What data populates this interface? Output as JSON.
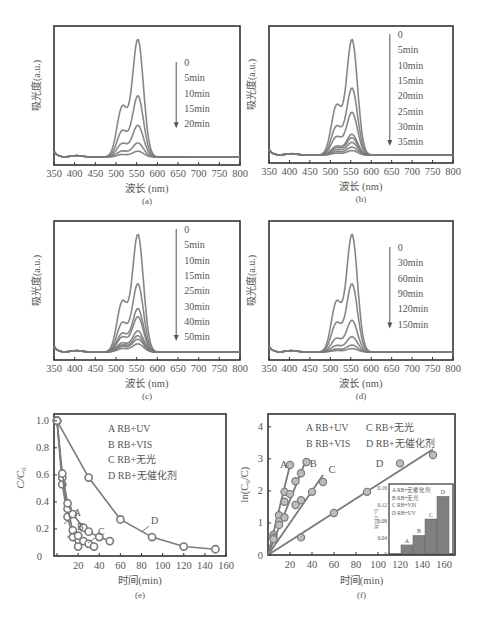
{
  "colors": {
    "axis": "#333333",
    "curve": "#7a7a7a",
    "text": "#555555",
    "marker_fill": "#bdbdbd",
    "marker_open": "#ffffff",
    "bar": "#808080"
  },
  "chart_data": [
    {
      "id": "a",
      "type": "line",
      "panel_label": "(a)",
      "xlabel": "波长 (nm)",
      "ylabel": "吸光度(a.u.)",
      "x_ticks": [
        350,
        400,
        450,
        500,
        550,
        600,
        650,
        700,
        750,
        800
      ],
      "xlim": [
        350,
        800
      ],
      "legend_arrow": true,
      "legend": [
        "0",
        "5min",
        "10min",
        "15min",
        "20min"
      ],
      "peak_wavelength": 550,
      "series": [
        {
          "name": "0",
          "peak": 1.0
        },
        {
          "name": "5min",
          "peak": 0.52
        },
        {
          "name": "10min",
          "peak": 0.27
        },
        {
          "name": "15min",
          "peak": 0.12
        },
        {
          "name": "20min",
          "peak": 0.05
        }
      ]
    },
    {
      "id": "b",
      "type": "line",
      "panel_label": "(b)",
      "xlabel": "波长 (nm)",
      "ylabel": "吸光度(a.u.)",
      "x_ticks": [
        350,
        400,
        450,
        500,
        550,
        600,
        650,
        700,
        750,
        800
      ],
      "xlim": [
        350,
        800
      ],
      "legend_arrow": true,
      "legend": [
        "0",
        "5min",
        "10min",
        "15min",
        "20min",
        "25min",
        "30min",
        "35min"
      ],
      "peak_wavelength": 550,
      "series": [
        {
          "name": "0",
          "peak": 1.0
        },
        {
          "name": "5min",
          "peak": 0.58
        },
        {
          "name": "10min",
          "peak": 0.37
        },
        {
          "name": "15min",
          "peak": 0.18
        },
        {
          "name": "20min",
          "peak": 0.15
        },
        {
          "name": "25min",
          "peak": 0.11
        },
        {
          "name": "30min",
          "peak": 0.07
        },
        {
          "name": "35min",
          "peak": 0.04
        }
      ]
    },
    {
      "id": "c",
      "type": "line",
      "panel_label": "(c)",
      "xlabel": "波长 (nm)",
      "ylabel": "吸光度(a.u.)",
      "x_ticks": [
        350,
        400,
        450,
        500,
        550,
        600,
        650,
        700,
        750,
        800
      ],
      "xlim": [
        350,
        800
      ],
      "legend_arrow": true,
      "legend": [
        "0",
        "5min",
        "10min",
        "15min",
        "25min",
        "30min",
        "40min",
        "50min"
      ],
      "peak_wavelength": 550,
      "series": [
        {
          "name": "0",
          "peak": 1.0
        },
        {
          "name": "5min",
          "peak": 0.58
        },
        {
          "name": "10min",
          "peak": 0.37
        },
        {
          "name": "15min",
          "peak": 0.3
        },
        {
          "name": "25min",
          "peak": 0.18
        },
        {
          "name": "30min",
          "peak": 0.14
        },
        {
          "name": "40min",
          "peak": 0.11
        },
        {
          "name": "50min",
          "peak": 0.07
        }
      ]
    },
    {
      "id": "d",
      "type": "line",
      "panel_label": "(d)",
      "xlabel": "波长 (nm)",
      "ylabel": "吸光度(a.u.)",
      "x_ticks": [
        350,
        400,
        450,
        500,
        550,
        600,
        650,
        700,
        750,
        800
      ],
      "xlim": [
        350,
        800
      ],
      "legend_arrow": true,
      "legend": [
        "0",
        "30min",
        "60min",
        "90min",
        "120min",
        "150min"
      ],
      "peak_wavelength": 550,
      "series": [
        {
          "name": "0",
          "peak": 1.0
        },
        {
          "name": "30min",
          "peak": 0.58
        },
        {
          "name": "60min",
          "peak": 0.27
        },
        {
          "name": "90min",
          "peak": 0.13
        },
        {
          "name": "120min",
          "peak": 0.06
        },
        {
          "name": "150min",
          "peak": 0.03
        }
      ]
    },
    {
      "id": "e",
      "type": "line",
      "panel_label": "(e)",
      "xlabel": "时间(min)",
      "ylabel": "C/C0",
      "x_ticks": [
        0,
        20,
        40,
        60,
        80,
        100,
        120,
        140,
        160
      ],
      "y_ticks": [
        0,
        0.2,
        0.4,
        0.6,
        0.8,
        1.0
      ],
      "xlim": [
        0,
        160
      ],
      "ylim": [
        0,
        1.05
      ],
      "legend": [
        "A  RB+UV",
        "B  RB+VIS",
        "C  RB+无光",
        "D  RB+无催化剂"
      ],
      "series": [
        {
          "name": "A",
          "label": "A",
          "x": [
            0,
            5,
            10,
            15,
            20
          ],
          "y": [
            1.0,
            0.53,
            0.29,
            0.14,
            0.07
          ]
        },
        {
          "name": "B",
          "label": "B",
          "x": [
            0,
            5,
            10,
            15,
            20,
            25,
            30,
            35
          ],
          "y": [
            1.0,
            0.58,
            0.35,
            0.19,
            0.15,
            0.11,
            0.09,
            0.07
          ]
        },
        {
          "name": "C",
          "label": "C",
          "x": [
            0,
            5,
            10,
            15,
            25,
            30,
            40,
            50
          ],
          "y": [
            1.0,
            0.61,
            0.39,
            0.31,
            0.21,
            0.18,
            0.14,
            0.11
          ]
        },
        {
          "name": "D",
          "label": "D",
          "x": [
            0,
            30,
            60,
            90,
            120,
            150
          ],
          "y": [
            1.0,
            0.58,
            0.27,
            0.14,
            0.07,
            0.05
          ]
        }
      ]
    },
    {
      "id": "f",
      "type": "scatter",
      "panel_label": "(f)",
      "xlabel": "时间(min)",
      "ylabel": "ln(C0/C)",
      "x_ticks": [
        20,
        40,
        60,
        80,
        100,
        120,
        140,
        160
      ],
      "y_ticks": [
        0,
        1,
        2,
        3,
        4
      ],
      "xlim": [
        0,
        170
      ],
      "ylim": [
        0,
        4.4
      ],
      "legend": [
        "A RB+UV",
        "C RB+无光",
        "B RB+VIS",
        "D RB+无催化剂"
      ],
      "series": [
        {
          "name": "A",
          "label": "A",
          "x": [
            5,
            10,
            15,
            20
          ],
          "y": [
            0.63,
            1.24,
            1.97,
            2.81
          ],
          "fit_end": [
            20,
            2.81
          ]
        },
        {
          "name": "B",
          "label": "B",
          "x": [
            5,
            10,
            15,
            20,
            25,
            30,
            35
          ],
          "y": [
            0.55,
            1.05,
            1.66,
            1.9,
            2.3,
            2.55,
            2.9
          ],
          "fit_end": [
            35,
            3.0
          ]
        },
        {
          "name": "C",
          "label": "C",
          "x": [
            5,
            10,
            15,
            25,
            30,
            40,
            50
          ],
          "y": [
            0.49,
            0.94,
            1.17,
            1.56,
            1.71,
            1.97,
            2.28
          ],
          "fit_end": [
            50,
            2.5
          ]
        },
        {
          "name": "D",
          "label": "D",
          "x": [
            30,
            60,
            90,
            120,
            150
          ],
          "y": [
            0.55,
            1.31,
            1.97,
            2.86,
            3.12
          ],
          "fit_end": [
            150,
            3.3
          ]
        }
      ],
      "inset": {
        "type": "bar",
        "ylabel": "k(min⁻¹)",
        "y_ticks": [
          0,
          0.04,
          0.08,
          0.12,
          0.16
        ],
        "ylim": [
          0,
          0.17
        ],
        "legend": [
          "A RB+无催化剂",
          "B RB+无光",
          "C RB+VIS",
          "D RB+UV"
        ],
        "categories": [
          "A",
          "B",
          "C",
          "D"
        ],
        "values": [
          0.022,
          0.045,
          0.085,
          0.14
        ]
      }
    }
  ]
}
